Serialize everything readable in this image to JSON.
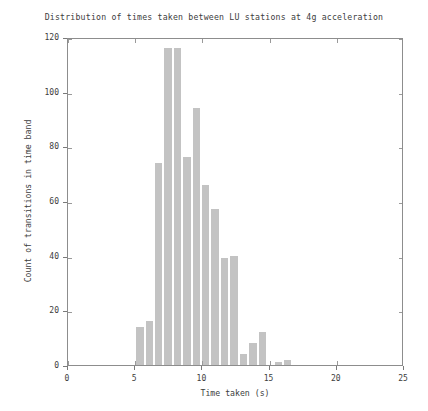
{
  "chart_data": {
    "type": "bar",
    "title": "Distribution of times taken between LU stations at 4g acceleration",
    "xlabel": "Time taken (s)",
    "ylabel": "Count of transitions in time band",
    "xlim": [
      0,
      25
    ],
    "ylim": [
      0,
      120
    ],
    "xticks": [
      0,
      5,
      10,
      15,
      20,
      25
    ],
    "yticks": [
      0,
      20,
      40,
      60,
      80,
      100,
      120
    ],
    "xtick_labels": [
      "0",
      "5",
      "10",
      "15",
      "20",
      "25"
    ],
    "ytick_labels": [
      "0",
      "20",
      "40",
      "60",
      "80",
      "100",
      "120"
    ],
    "grid": false,
    "legend": null,
    "bin_width": 0.5,
    "bar_color": "#c3c3c3",
    "bins": [
      {
        "x0": 5.0,
        "x1": 5.5,
        "value": 14
      },
      {
        "x0": 5.5,
        "x1": 6.0,
        "value": 0
      },
      {
        "x0": 6.0,
        "x1": 6.5,
        "value": 16
      },
      {
        "x0": 6.5,
        "x1": 7.0,
        "value": 0
      },
      {
        "x0": 7.0,
        "x1": 7.5,
        "value": 74
      },
      {
        "x0": 7.5,
        "x1": 8.0,
        "value": 0
      },
      {
        "x0": 8.0,
        "x1": 8.5,
        "value": 116
      },
      {
        "x0": 8.5,
        "x1": 9.0,
        "value": 116
      },
      {
        "x0": 9.0,
        "x1": 9.5,
        "value": 76
      },
      {
        "x0": 9.5,
        "x1": 10.0,
        "value": 0
      },
      {
        "x0": 10.0,
        "x1": 10.5,
        "value": 94
      },
      {
        "x0": 10.5,
        "x1": 11.0,
        "value": 0
      },
      {
        "x0": 11.0,
        "x1": 11.5,
        "value": 66
      },
      {
        "x0": 11.5,
        "x1": 12.0,
        "value": 0
      },
      {
        "x0": 12.0,
        "x1": 12.5,
        "value": 57
      },
      {
        "x0": 12.5,
        "x1": 13.0,
        "value": 0
      },
      {
        "x0": 13.0,
        "x1": 13.5,
        "value": 39
      },
      {
        "x0": 13.5,
        "x1": 14.0,
        "value": 40
      },
      {
        "x0": 14.0,
        "x1": 14.5,
        "value": 4
      },
      {
        "x0": 14.5,
        "x1": 15.0,
        "value": 8
      },
      {
        "x0": 15.0,
        "x1": 15.5,
        "value": 12
      },
      {
        "x0": 15.5,
        "x1": 16.0,
        "value": 0
      },
      {
        "x0": 16.0,
        "x1": 16.5,
        "value": 1
      },
      {
        "x0": 16.5,
        "x1": 17.0,
        "value": 2
      }
    ],
    "bars_plotted": [
      {
        "left": 5.0,
        "width": 0.5,
        "value": 14
      },
      {
        "left": 5.5,
        "width": 0.5,
        "value": 16
      },
      {
        "left": 6.0,
        "width": 0.5,
        "value": 74
      },
      {
        "left": 6.5,
        "width": 0.5,
        "value": 116
      },
      {
        "left": 7.0,
        "width": 0.5,
        "value": 116
      },
      {
        "left": 7.5,
        "width": 0.5,
        "value": 76
      },
      {
        "left": 8.0,
        "width": 0.5,
        "value": 94
      },
      {
        "left": 8.5,
        "width": 0.5,
        "value": 66
      },
      {
        "left": 9.0,
        "width": 0.5,
        "value": 57
      },
      {
        "left": 9.5,
        "width": 0.5,
        "value": 39
      },
      {
        "left": 10.0,
        "width": 0.5,
        "value": 40
      },
      {
        "left": 10.5,
        "width": 0.5,
        "value": 4
      },
      {
        "left": 11.0,
        "width": 0.5,
        "value": 8
      },
      {
        "left": 11.5,
        "width": 0.5,
        "value": 12
      },
      {
        "left": 12.0,
        "width": 0.5,
        "value": 1
      },
      {
        "left": 12.5,
        "width": 0.5,
        "value": 2
      }
    ],
    "bars": [
      {
        "left": 5.0,
        "right": 5.5,
        "value": 14
      },
      {
        "left": 5.5,
        "right": 6.0,
        "value": 0
      },
      {
        "left": 6.0,
        "right": 6.5,
        "value": 16
      },
      {
        "left": 6.5,
        "right": 7.0,
        "value": 0
      },
      {
        "left": 7.0,
        "right": 7.5,
        "value": 74
      },
      {
        "left": 7.5,
        "right": 8.0,
        "value": 74
      },
      {
        "left": 8.0,
        "right": 8.5,
        "value": 116
      },
      {
        "left": 8.5,
        "right": 9.0,
        "value": 116
      },
      {
        "left": 9.0,
        "right": 9.5,
        "value": 76
      },
      {
        "left": 9.5,
        "right": 10.0,
        "value": 76
      },
      {
        "left": 10.0,
        "right": 10.5,
        "value": 94
      },
      {
        "left": 10.5,
        "right": 11.0,
        "value": 94
      },
      {
        "left": 11.0,
        "right": 11.5,
        "value": 66
      },
      {
        "left": 11.5,
        "right": 12.0,
        "value": 66
      },
      {
        "left": 12.0,
        "right": 12.5,
        "value": 57
      },
      {
        "left": 12.5,
        "right": 13.0,
        "value": 57
      },
      {
        "left": 13.0,
        "right": 13.5,
        "value": 39
      },
      {
        "left": 13.5,
        "right": 14.0,
        "value": 40
      },
      {
        "left": 14.0,
        "right": 14.5,
        "value": 4
      },
      {
        "left": 14.5,
        "right": 15.0,
        "value": 8
      },
      {
        "left": 15.0,
        "right": 15.5,
        "value": 12
      },
      {
        "left": 15.5,
        "right": 16.0,
        "value": 0
      },
      {
        "left": 16.0,
        "right": 16.5,
        "value": 1
      },
      {
        "left": 16.5,
        "right": 17.0,
        "value": 2
      }
    ],
    "rects": [
      {
        "x0": 5.0,
        "x1": 5.5,
        "h": 14
      },
      {
        "x0": 6.0,
        "x1": 6.5,
        "h": 16
      },
      {
        "x0": 6.9,
        "x1": 7.5,
        "h": 74
      },
      {
        "x0": 7.5,
        "x1": 8.0,
        "h": 116
      },
      {
        "x0": 8.0,
        "x1": 8.5,
        "h": 116
      },
      {
        "x0": 8.5,
        "x1": 9.0,
        "h": 76
      },
      {
        "x0": 9.0,
        "x1": 9.5,
        "h": 94
      },
      {
        "x0": 9.5,
        "x1": 10.0,
        "h": 66
      },
      {
        "x0": 10.0,
        "x1": 10.5,
        "h": 57
      },
      {
        "x0": 10.5,
        "x1": 11.0,
        "h": 39
      },
      {
        "x0": 11.0,
        "x1": 11.5,
        "h": 40
      },
      {
        "x0": 11.5,
        "x1": 12.0,
        "h": 4
      },
      {
        "x0": 12.0,
        "x1": 12.5,
        "h": 8
      },
      {
        "x0": 12.5,
        "x1": 13.0,
        "h": 12
      },
      {
        "x0": 13.5,
        "x1": 14.0,
        "h": 1
      },
      {
        "x0": 14.0,
        "x1": 14.5,
        "h": 2
      }
    ],
    "rendered_bars": [
      {
        "x0": 5.0,
        "x1": 5.5,
        "value": 14
      },
      {
        "x0": 5.5,
        "x1": 6.0,
        "value": 16
      },
      {
        "x0": 6.0,
        "x1": 6.5,
        "value": 16
      },
      {
        "x0": 6.5,
        "x1": 7.0,
        "value": 74
      },
      {
        "x0": 7.0,
        "x1": 7.5,
        "value": 116
      },
      {
        "x0": 7.5,
        "x1": 8.0,
        "value": 116
      },
      {
        "x0": 8.0,
        "x1": 8.5,
        "value": 76
      },
      {
        "x0": 8.5,
        "x1": 9.0,
        "value": 94
      },
      {
        "x0": 9.0,
        "x1": 9.5,
        "value": 66
      },
      {
        "x0": 9.5,
        "x1": 10.0,
        "value": 57
      },
      {
        "x0": 10.0,
        "x1": 10.5,
        "value": 39
      },
      {
        "x0": 10.5,
        "x1": 11.0,
        "value": 40
      },
      {
        "x0": 11.0,
        "x1": 11.5,
        "value": 4
      },
      {
        "x0": 11.5,
        "x1": 12.0,
        "value": 8
      },
      {
        "x0": 12.0,
        "x1": 12.5,
        "value": 12
      },
      {
        "x0": 13.0,
        "x1": 13.5,
        "value": 1
      },
      {
        "x0": 13.5,
        "x1": 14.0,
        "value": 2
      }
    ],
    "final_bars": [
      {
        "x0": 5.0,
        "x1": 5.7,
        "value": 14
      },
      {
        "x0": 5.7,
        "x1": 6.4,
        "value": 16
      },
      {
        "x0": 6.4,
        "x1": 7.1,
        "value": 74
      },
      {
        "x0": 7.1,
        "x1": 7.8,
        "value": 116
      },
      {
        "x0": 7.8,
        "x1": 8.5,
        "value": 116
      },
      {
        "x0": 8.5,
        "x1": 9.2,
        "value": 76
      },
      {
        "x0": 9.2,
        "x1": 9.9,
        "value": 94
      },
      {
        "x0": 9.9,
        "x1": 10.6,
        "value": 66
      },
      {
        "x0": 10.6,
        "x1": 11.3,
        "value": 57
      },
      {
        "x0": 11.3,
        "x1": 12.0,
        "value": 39
      },
      {
        "x0": 12.0,
        "x1": 12.7,
        "value": 40
      },
      {
        "x0": 12.7,
        "x1": 13.4,
        "value": 4
      },
      {
        "x0": 13.4,
        "x1": 14.1,
        "value": 8
      },
      {
        "x0": 14.1,
        "x1": 14.8,
        "value": 12
      },
      {
        "x0": 15.3,
        "x1": 16.0,
        "value": 1
      },
      {
        "x0": 16.0,
        "x1": 16.7,
        "value": 2
      }
    ],
    "histogram": {
      "edges": [
        5.0,
        5.7,
        6.4,
        7.1,
        7.8,
        8.5,
        9.2,
        9.9,
        10.6,
        11.3,
        12.0,
        12.7,
        13.4,
        14.1,
        14.8,
        15.5,
        16.2,
        16.9,
        17.6,
        18.3,
        19.0,
        20.3,
        21.0,
        21.7
      ],
      "counts": [
        14,
        16,
        74,
        116,
        116,
        76,
        94,
        66,
        57,
        39,
        40,
        4,
        8,
        12,
        1,
        2
      ]
    }
  }
}
